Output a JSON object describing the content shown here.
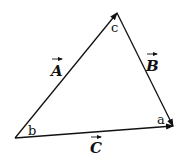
{
  "diagram": {
    "type": "vector-triangle",
    "colors": {
      "stroke": "#111111",
      "background": "#ffffff"
    },
    "vertices": [
      {
        "id": "b",
        "label": "b",
        "x": 15,
        "y": 138
      },
      {
        "id": "c",
        "label": "c",
        "x": 117,
        "y": 13
      },
      {
        "id": "a",
        "label": "a",
        "x": 173,
        "y": 126
      }
    ],
    "vectors": [
      {
        "name": "A",
        "label": "A",
        "from": "b",
        "to": "c"
      },
      {
        "name": "B",
        "label": "B",
        "from": "c",
        "to": "a"
      },
      {
        "name": "C",
        "label": "C",
        "from": "b",
        "to": "a"
      }
    ]
  }
}
